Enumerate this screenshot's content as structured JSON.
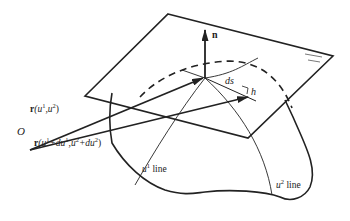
{
  "diagram": {
    "labels": {
      "normal": "n",
      "arc_length": "ds",
      "height": "h",
      "origin": "O",
      "r1_bold": "r",
      "r1_args_a": "(u",
      "r1_sup_a": "1",
      "r1_args_b": ",u",
      "r1_sup_b": "2",
      "r1_close": ")",
      "r2_bold": "r",
      "r2_a": "(u",
      "r2_s1": "1",
      "r2_b": "+du",
      "r2_s2": "1",
      "r2_c": ",u",
      "r2_s3": "2",
      "r2_d": "+du",
      "r2_s4": "2",
      "r2_close": ")",
      "u1_line_u": "u",
      "u1_line_sup": "1",
      "u1_line_text": " line",
      "u2_line_u": "u",
      "u2_line_sup": "2",
      "u2_line_text": " line"
    },
    "colors": {
      "stroke": "#222222",
      "background": "#ffffff"
    }
  }
}
